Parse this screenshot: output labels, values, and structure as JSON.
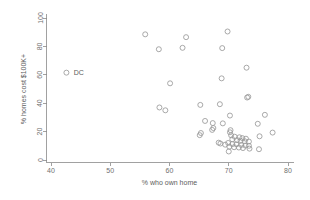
{
  "chart_data": {
    "type": "scatter",
    "title": "",
    "subtitle": "",
    "xlabel": "% who own home",
    "ylabel": "% homes cost $100K+",
    "xlim": [
      38,
      82
    ],
    "ylim": [
      -2,
      102
    ],
    "xticks": [
      40,
      50,
      60,
      70,
      80
    ],
    "yticks": [
      0,
      20,
      40,
      60,
      80,
      100
    ],
    "xtick_labels": [
      "40",
      "50",
      "60",
      "70",
      "80"
    ],
    "ytick_labels": [
      "0",
      "20",
      "40",
      "60",
      "80",
      "100"
    ],
    "grid": false,
    "legend": "none",
    "marker": "open-circle",
    "marker_color": "#9a9a9a",
    "series": [
      {
        "name": "states",
        "points": [
          {
            "x": 42.6,
            "y": 61.5,
            "label": "DC"
          },
          {
            "x": 55.9,
            "y": 88.5,
            "label": ""
          },
          {
            "x": 58.2,
            "y": 78.0,
            "label": ""
          },
          {
            "x": 62.2,
            "y": 79.0,
            "label": ""
          },
          {
            "x": 62.8,
            "y": 86.5,
            "label": ""
          },
          {
            "x": 69.8,
            "y": 90.5,
            "label": ""
          },
          {
            "x": 68.9,
            "y": 78.8,
            "label": ""
          },
          {
            "x": 73.0,
            "y": 65.0,
            "label": ""
          },
          {
            "x": 68.8,
            "y": 57.5,
            "label": ""
          },
          {
            "x": 60.1,
            "y": 54.0,
            "label": ""
          },
          {
            "x": 73.3,
            "y": 44.5,
            "label": ""
          },
          {
            "x": 73.1,
            "y": 44.0,
            "label": ""
          },
          {
            "x": 68.5,
            "y": 39.3,
            "label": ""
          },
          {
            "x": 65.2,
            "y": 38.8,
            "label": ""
          },
          {
            "x": 58.3,
            "y": 37.0,
            "label": ""
          },
          {
            "x": 59.3,
            "y": 35.0,
            "label": ""
          },
          {
            "x": 76.1,
            "y": 31.8,
            "label": ""
          },
          {
            "x": 70.2,
            "y": 31.3,
            "label": ""
          },
          {
            "x": 66.0,
            "y": 27.5,
            "label": ""
          },
          {
            "x": 67.3,
            "y": 26.0,
            "label": ""
          },
          {
            "x": 69.0,
            "y": 25.8,
            "label": ""
          },
          {
            "x": 74.9,
            "y": 25.5,
            "label": ""
          },
          {
            "x": 67.4,
            "y": 22.5,
            "label": ""
          },
          {
            "x": 67.2,
            "y": 21.2,
            "label": ""
          },
          {
            "x": 70.3,
            "y": 21.0,
            "label": ""
          },
          {
            "x": 70.2,
            "y": 19.5,
            "label": ""
          },
          {
            "x": 65.3,
            "y": 19.0,
            "label": ""
          },
          {
            "x": 65.1,
            "y": 17.5,
            "label": ""
          },
          {
            "x": 77.4,
            "y": 19.3,
            "label": ""
          },
          {
            "x": 75.2,
            "y": 16.7,
            "label": ""
          },
          {
            "x": 70.4,
            "y": 17.4,
            "label": ""
          },
          {
            "x": 71.0,
            "y": 16.4,
            "label": ""
          },
          {
            "x": 71.8,
            "y": 16.0,
            "label": ""
          },
          {
            "x": 72.3,
            "y": 15.4,
            "label": ""
          },
          {
            "x": 72.9,
            "y": 15.0,
            "label": ""
          },
          {
            "x": 70.6,
            "y": 14.6,
            "label": ""
          },
          {
            "x": 71.4,
            "y": 14.0,
            "label": ""
          },
          {
            "x": 72.0,
            "y": 13.5,
            "label": ""
          },
          {
            "x": 72.7,
            "y": 13.2,
            "label": ""
          },
          {
            "x": 73.4,
            "y": 13.0,
            "label": ""
          },
          {
            "x": 68.3,
            "y": 12.2,
            "label": ""
          },
          {
            "x": 68.6,
            "y": 11.6,
            "label": ""
          },
          {
            "x": 69.9,
            "y": 12.0,
            "label": ""
          },
          {
            "x": 70.6,
            "y": 11.2,
            "label": ""
          },
          {
            "x": 71.3,
            "y": 11.0,
            "label": ""
          },
          {
            "x": 72.1,
            "y": 10.6,
            "label": ""
          },
          {
            "x": 72.8,
            "y": 10.2,
            "label": ""
          },
          {
            "x": 73.4,
            "y": 10.0,
            "label": ""
          },
          {
            "x": 70.1,
            "y": 9.4,
            "label": ""
          },
          {
            "x": 70.9,
            "y": 9.0,
            "label": ""
          },
          {
            "x": 71.7,
            "y": 8.8,
            "label": ""
          },
          {
            "x": 72.4,
            "y": 8.4,
            "label": ""
          },
          {
            "x": 73.5,
            "y": 8.0,
            "label": ""
          },
          {
            "x": 75.1,
            "y": 7.6,
            "label": ""
          },
          {
            "x": 70.0,
            "y": 6.0,
            "label": ""
          },
          {
            "x": 69.4,
            "y": 10.8,
            "label": ""
          }
        ]
      }
    ],
    "annotations": [
      {
        "text": "DC",
        "x": 44.7,
        "y": 61.5
      }
    ]
  }
}
